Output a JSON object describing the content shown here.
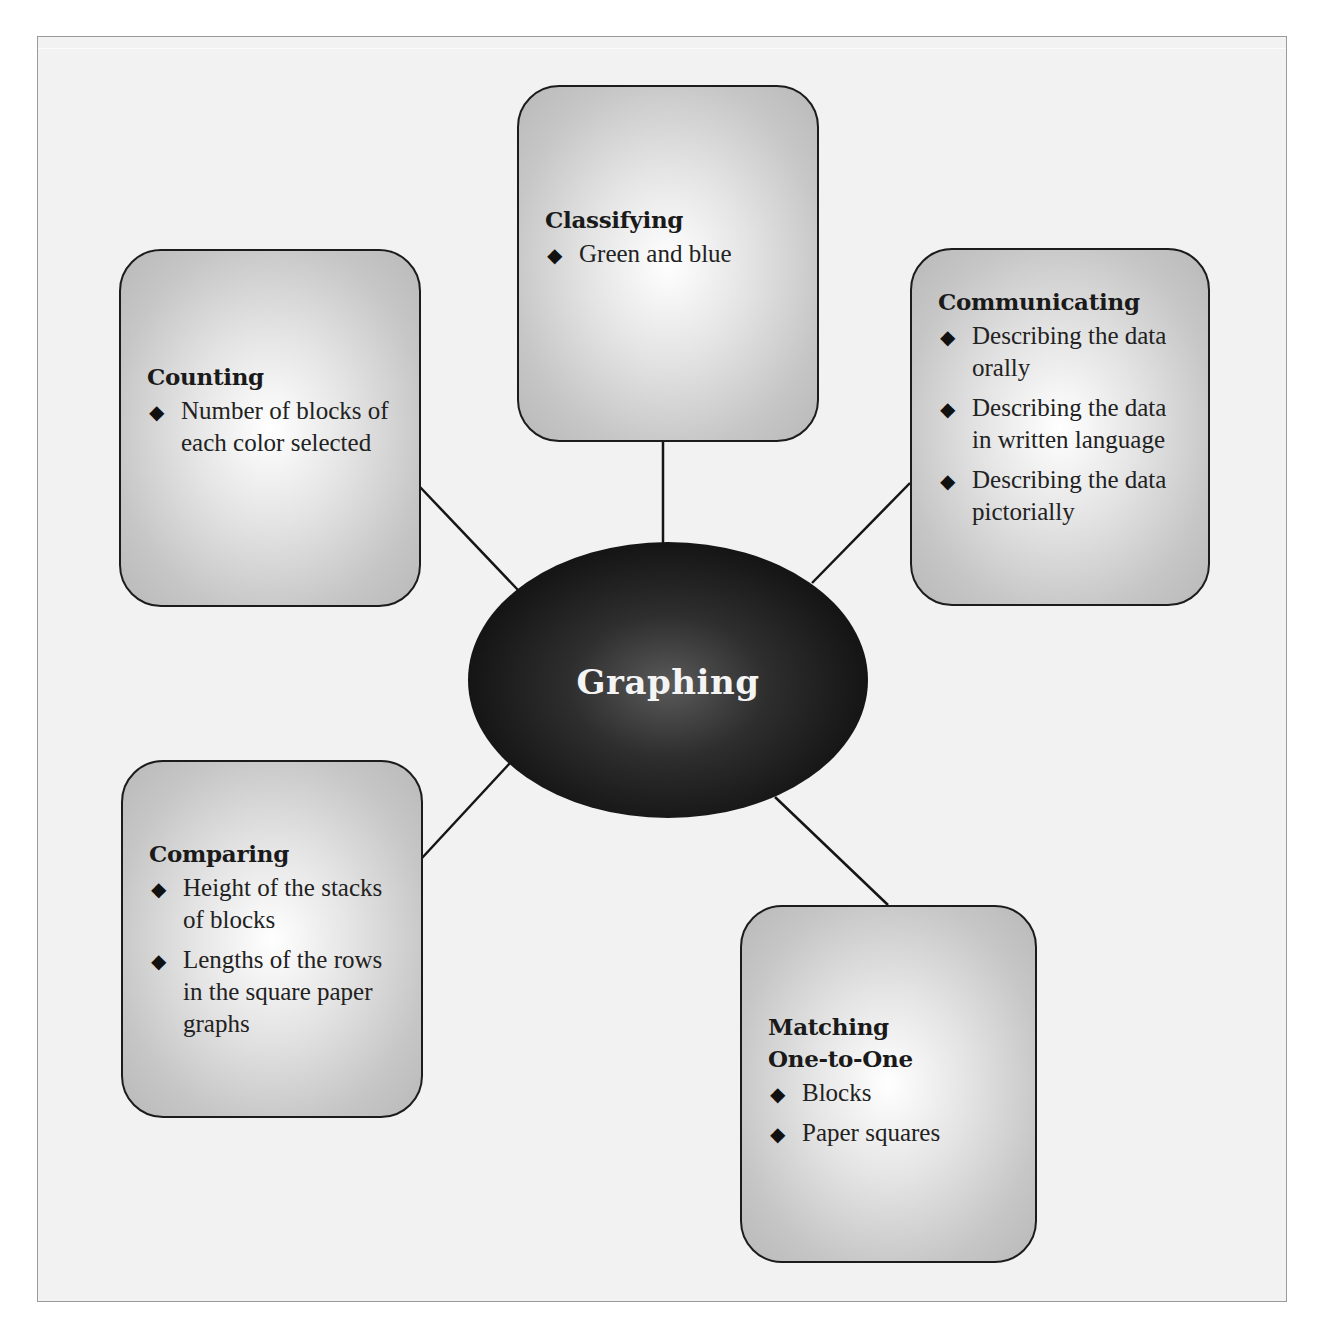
{
  "diagram": {
    "center": {
      "label": "Graphing"
    },
    "nodes": [
      {
        "id": "classifying",
        "title": "Classifying",
        "items": [
          "Green and blue"
        ]
      },
      {
        "id": "counting",
        "title": "Counting",
        "items": [
          "Number of blocks of each color selected"
        ]
      },
      {
        "id": "communicating",
        "title": "Communicating",
        "items": [
          "Describing the data orally",
          "Describing the data in written language",
          "Describing the data pictorially"
        ]
      },
      {
        "id": "comparing",
        "title": "Comparing",
        "items": [
          "Height of the stacks of blocks",
          "Lengths of the rows in the square paper graphs"
        ]
      },
      {
        "id": "matching",
        "title": "Matching One-to-One",
        "items": [
          "Blocks",
          "Paper squares"
        ]
      }
    ],
    "bullet_icon": "◆",
    "colors": {
      "frame_bg": "#f2f2f2",
      "frame_border": "#9a9a9a",
      "hub_fill": "#151515",
      "hub_text": "#f4f4f4",
      "box_border": "#1c1c1c"
    }
  }
}
